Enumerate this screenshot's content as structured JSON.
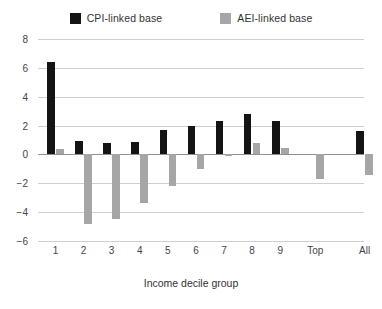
{
  "chart_data": {
    "type": "bar",
    "title": "",
    "xlabel": "Income decile group",
    "ylabel": "",
    "categories": [
      "1",
      "2",
      "3",
      "4",
      "5",
      "6",
      "7",
      "8",
      "9",
      "Top",
      "All"
    ],
    "series": [
      {
        "name": "CPI-linked base",
        "color": "#141414",
        "values": [
          6.4,
          0.9,
          0.8,
          0.85,
          1.7,
          2.0,
          2.3,
          2.8,
          2.3,
          0.0,
          1.6
        ]
      },
      {
        "name": "AEI-linked base",
        "color": "#a6a6a6",
        "values": [
          0.35,
          -4.8,
          -4.5,
          -3.4,
          -2.2,
          -1.0,
          -0.1,
          0.8,
          0.45,
          -1.7,
          -1.45
        ]
      }
    ],
    "ylim": [
      -6,
      8
    ],
    "yticks": [
      8,
      6,
      4,
      2,
      0,
      -2,
      -4,
      -6
    ],
    "ytick_labels": [
      "8",
      "6",
      "4",
      "2",
      "0",
      "−2",
      "−4",
      "−6"
    ],
    "grid": true,
    "legend_position": "top"
  },
  "legend": {
    "items": [
      {
        "label": "CPI-linked base",
        "color": "#141414",
        "swatch": "legend-swatch-cpi"
      },
      {
        "label": "AEI-linked base",
        "color": "#a6a6a6",
        "swatch": "legend-swatch-aei"
      }
    ]
  }
}
